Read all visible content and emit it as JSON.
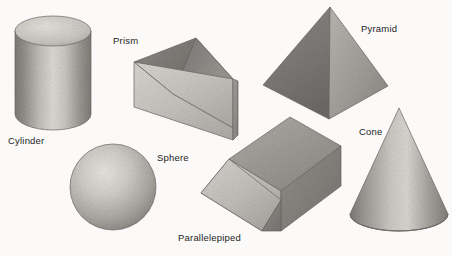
{
  "figure": {
    "background_color": "#fbfaf8",
    "text_color": "#1d1d1d",
    "width": 452,
    "height": 256
  },
  "shapes": [
    {
      "id": "cylinder",
      "label": "Cylinder",
      "icon": "cylinder-icon",
      "label_position": {
        "x": 8,
        "y": 136
      },
      "bounds": {
        "x": 15,
        "y": 17,
        "w": 76,
        "h": 112
      }
    },
    {
      "id": "prism",
      "label": "Prism",
      "icon": "triangular-prism-icon",
      "label_position": {
        "x": 113,
        "y": 36
      },
      "bounds": {
        "x": 134,
        "y": 38,
        "w": 100,
        "h": 102
      }
    },
    {
      "id": "sphere",
      "label": "Sphere",
      "icon": "sphere-icon",
      "label_position": {
        "x": 157,
        "y": 153
      },
      "bounds": {
        "x": 70,
        "y": 144,
        "w": 86,
        "h": 86
      }
    },
    {
      "id": "parallelepiped",
      "label": "Parallelepiped",
      "icon": "parallelepiped-icon",
      "label_position": {
        "x": 178,
        "y": 233
      },
      "bounds": {
        "x": 201,
        "y": 117,
        "w": 140,
        "h": 114
      }
    },
    {
      "id": "pyramid",
      "label": "Pyramid",
      "icon": "pyramid-icon",
      "label_position": {
        "x": 361,
        "y": 24
      },
      "bounds": {
        "x": 263,
        "y": 7,
        "w": 125,
        "h": 112
      }
    },
    {
      "id": "cone",
      "label": "Cone",
      "icon": "cone-icon",
      "label_position": {
        "x": 359,
        "y": 127
      },
      "bounds": {
        "x": 350,
        "y": 107,
        "w": 96,
        "h": 123
      }
    }
  ],
  "palette": {
    "light": "#d9d6d2",
    "mid": "#b4b0ab",
    "dark": "#8d8984",
    "darker": "#777370",
    "outline": "#6a6664",
    "highlight": "#e8e5e1"
  }
}
